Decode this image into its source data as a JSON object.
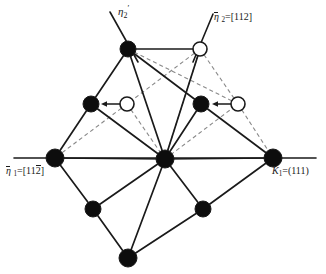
{
  "figure": {
    "width": 326,
    "height": 274,
    "background": "#ffffff",
    "line_color": "#1a1a1a",
    "dashed_color": "#8a8a8a",
    "node_fill": "#0d0d0d",
    "node_open_fill": "#ffffff"
  },
  "labels": {
    "eta2_prime": {
      "symbol": "η",
      "sub": "2",
      "sup": "′",
      "text": "η₂′"
    },
    "eta2": {
      "symbol": "η",
      "sub": "2",
      "eq": "=[112]",
      "text": "η₂=[112]"
    },
    "eta1": {
      "symbol": "η",
      "sub": "1",
      "eq": "=[11",
      "bar": "2",
      "close": "]",
      "text": "η̄₁=[11̒2̅]"
    },
    "k1": {
      "symbol": "K",
      "sub": "1",
      "eq": "=(111)",
      "text": "K₁=(111)"
    }
  },
  "chart_data": {
    "type": "diagram",
    "nodes": [
      {
        "id": "n-top-left",
        "name": "top-left-filled-node",
        "x": 128,
        "y": 49,
        "kind": "filled",
        "r": 8
      },
      {
        "id": "n-top-right",
        "name": "top-right-open-node",
        "x": 200,
        "y": 49,
        "kind": "open",
        "r": 7
      },
      {
        "id": "n-mid-left-f",
        "name": "mid-left-filled-node",
        "x": 91,
        "y": 104,
        "kind": "filled",
        "r": 8
      },
      {
        "id": "n-mid-left-o",
        "name": "mid-left-open-node",
        "x": 127,
        "y": 104,
        "kind": "open",
        "r": 7
      },
      {
        "id": "n-mid-right-f",
        "name": "mid-right-filled-node",
        "x": 201,
        "y": 104,
        "kind": "filled",
        "r": 8
      },
      {
        "id": "n-mid-right-o",
        "name": "mid-right-open-node",
        "x": 238,
        "y": 104,
        "kind": "open",
        "r": 7
      },
      {
        "id": "n-left",
        "name": "left-filled-node",
        "x": 55,
        "y": 158,
        "kind": "filled",
        "r": 9
      },
      {
        "id": "n-center",
        "name": "center-filled-node",
        "x": 165,
        "y": 159,
        "kind": "filled",
        "r": 9
      },
      {
        "id": "n-right",
        "name": "right-filled-node",
        "x": 273,
        "y": 158,
        "kind": "filled",
        "r": 9
      },
      {
        "id": "n-bot-left",
        "name": "bottom-left-filled-node",
        "x": 93,
        "y": 209,
        "kind": "filled",
        "r": 8
      },
      {
        "id": "n-bot-right",
        "name": "bottom-right-filled-node",
        "x": 203,
        "y": 209,
        "kind": "filled",
        "r": 8
      },
      {
        "id": "n-bottom",
        "name": "bottom-filled-node",
        "x": 128,
        "y": 258,
        "kind": "filled",
        "r": 9
      }
    ],
    "solid_edges": [
      [
        "n-top-left",
        "n-top-right"
      ],
      [
        "n-top-left",
        "n-mid-left-f"
      ],
      [
        "n-top-left",
        "n-center"
      ],
      [
        "n-top-left",
        "n-mid-right-f"
      ],
      [
        "n-mid-left-f",
        "n-left"
      ],
      [
        "n-mid-left-f",
        "n-center"
      ],
      [
        "n-mid-right-f",
        "n-center"
      ],
      [
        "n-mid-right-f",
        "n-right"
      ],
      [
        "n-left",
        "n-center"
      ],
      [
        "n-center",
        "n-right"
      ],
      [
        "n-left",
        "n-bot-left"
      ],
      [
        "n-bot-left",
        "n-bottom"
      ],
      [
        "n-bot-left",
        "n-center"
      ],
      [
        "n-center",
        "n-bottom"
      ],
      [
        "n-center",
        "n-bot-right"
      ],
      [
        "n-bot-right",
        "n-bottom"
      ],
      [
        "n-bot-right",
        "n-right"
      ],
      [
        "n-top-right",
        "n-center"
      ]
    ],
    "dashed_edges": [
      [
        "n-center",
        "n-mid-left-o"
      ],
      [
        "n-center",
        "n-mid-right-o"
      ],
      [
        "n-center",
        "n-top-right"
      ],
      [
        "n-top-left",
        "n-mid-right-o"
      ],
      [
        "n-top-right",
        "n-mid-left-o"
      ],
      [
        "n-top-right",
        "n-mid-right-o"
      ],
      [
        "n-mid-right-o",
        "n-right"
      ],
      [
        "n-mid-left-o",
        "n-left"
      ]
    ],
    "arrows": [
      {
        "name": "shear-arrow-left",
        "from": {
          "x": 120,
          "y": 104
        },
        "to": {
          "x": 101,
          "y": 104
        }
      },
      {
        "name": "shear-arrow-right",
        "from": {
          "x": 231,
          "y": 104
        },
        "to": {
          "x": 212,
          "y": 104
        }
      }
    ],
    "axis_lines": [
      {
        "name": "eta2-prime-axis",
        "x1": 110,
        "y1": 12,
        "x2": 138,
        "y2": 62
      },
      {
        "name": "eta2-axis",
        "x1": 213,
        "y1": 14,
        "x2": 193,
        "y2": 62
      },
      {
        "name": "eta1-k1-axis",
        "x1": 14,
        "y1": 158,
        "x2": 316,
        "y2": 158
      }
    ]
  }
}
